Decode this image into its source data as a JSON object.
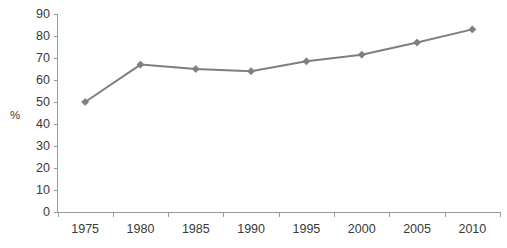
{
  "chart_data": {
    "type": "line",
    "title": "",
    "subtitle": "",
    "xlabel": "",
    "ylabel": "%",
    "categories": [
      "1975",
      "1980",
      "1985",
      "1990",
      "1995",
      "2000",
      "2005",
      "2010"
    ],
    "values": [
      50,
      67,
      65,
      64,
      68.5,
      71.5,
      77,
      83
    ],
    "series": [
      {
        "name": "",
        "values": [
          50,
          67,
          65,
          64,
          68.5,
          71.5,
          77,
          83
        ]
      }
    ],
    "ylim": [
      0,
      90
    ],
    "ytick_labels": [
      "0",
      "10",
      "20",
      "30",
      "40",
      "50",
      "60",
      "70",
      "80",
      "90"
    ],
    "ytick_values": [
      0,
      10,
      20,
      30,
      40,
      50,
      60,
      70,
      80,
      90
    ],
    "xtick_labels": [
      "1975",
      "1980",
      "1985",
      "1990",
      "1995",
      "2000",
      "2005",
      "2010"
    ],
    "grid": false,
    "legend": false,
    "legend_position": "none",
    "marker": "diamond",
    "colors": {
      "line": "#7f7f7f",
      "marker": "#7f7f7f",
      "axis": "#9a9a9a",
      "text": "#3a3a3a",
      "background": "#ffffff"
    }
  }
}
